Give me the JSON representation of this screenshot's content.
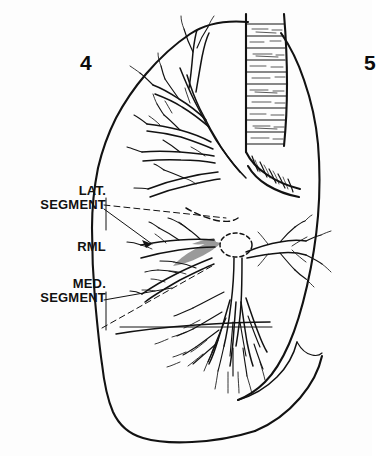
{
  "figure": {
    "panel_number_left": "4",
    "panel_number_right": "5",
    "background_color": "#fdfdfd",
    "ink_color": "#121212",
    "shade_color": "#9a9a9a"
  },
  "labels": {
    "lat_segment": "LAT.\nSEGMENT",
    "rml": "RML",
    "med_segment": "MED.\nSEGMENT"
  },
  "annotations": {
    "lat_segment_leaders": [
      "dashed-leader",
      "solid-leader"
    ],
    "med_segment_leaders": [
      "solid-leader",
      "dashed-leader"
    ],
    "hilum_marker": "dashed-ellipse",
    "shaded_region": "right-middle-lobe-bronchus"
  },
  "anatomy": {
    "trachea": "trachea-with-cartilage-rings",
    "bronchus_intermedius": "bronchus-intermedius-with-cartilage-rings",
    "lobes": [
      "right-upper-lobe",
      "right-middle-lobe",
      "right-lower-lobe"
    ],
    "view": "lateral"
  }
}
